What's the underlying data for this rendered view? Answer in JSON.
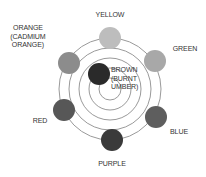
{
  "diagram": {
    "title": "",
    "center": {
      "x": 110,
      "y": 89
    },
    "rings": [
      50,
      40,
      30,
      20,
      10
    ],
    "ring_color": "#9a9a9a",
    "nodes": [
      {
        "id": "yellow",
        "label": "YELLOW",
        "x": 110,
        "y": 38,
        "r": 11,
        "fill": "#bdbdbd"
      },
      {
        "id": "green",
        "label": "GREEN",
        "x": 155,
        "y": 61,
        "r": 11,
        "fill": "#a8a8a8"
      },
      {
        "id": "blue",
        "label": "BLUE",
        "x": 156,
        "y": 117,
        "r": 11,
        "fill": "#5e5e5e"
      },
      {
        "id": "purple",
        "label": "PURPLE",
        "x": 112,
        "y": 140,
        "r": 11,
        "fill": "#3a3a3a"
      },
      {
        "id": "red",
        "label": "RED",
        "x": 64,
        "y": 110,
        "r": 11,
        "fill": "#575757"
      },
      {
        "id": "orange",
        "label": "ORANGE (CADMIUM ORANGE)",
        "x": 69,
        "y": 63,
        "r": 11,
        "fill": "#8c8c8c"
      },
      {
        "id": "brown",
        "label": "BROWN (BURNT UMBER)",
        "x": 99,
        "y": 74,
        "r": 11,
        "fill": "#2a2a2a"
      }
    ]
  },
  "labels": {
    "yellow": "YELLOW",
    "green": "GREEN",
    "blue": "BLUE",
    "purple": "PURPLE",
    "red": "RED",
    "orange_1": "ORANGE",
    "orange_2": "(CADMIUM",
    "orange_3": "ORANGE)",
    "brown_1": "BROWN",
    "brown_2": "(BURNT",
    "brown_3": "UMBER)"
  }
}
